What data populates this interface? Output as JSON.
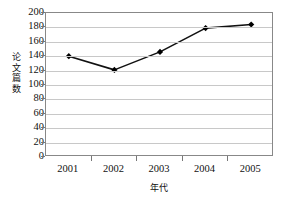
{
  "chart_data": {
    "type": "line",
    "title": "",
    "xlabel": "年代",
    "ylabel": "论文篇数",
    "categories": [
      "2001",
      "2002",
      "2003",
      "2004",
      "2005"
    ],
    "values": [
      140,
      121,
      146,
      179,
      184
    ],
    "series": [
      {
        "name": "论文篇数",
        "values": [
          140,
          121,
          146,
          179,
          184
        ]
      }
    ],
    "ylim": [
      0,
      200
    ],
    "ytick_labels": [
      "0",
      "20",
      "40",
      "60",
      "80",
      "100",
      "120",
      "140",
      "160",
      "180",
      "200"
    ],
    "ytick_values": [
      0,
      20,
      40,
      60,
      80,
      100,
      120,
      140,
      160,
      180,
      200
    ],
    "grid": "horizontal",
    "legend": "none",
    "line_color": "#111111",
    "marker": "diamond",
    "marker_color": "#000000",
    "grid_color": "#c8c8c8",
    "frame_color": "#888888"
  }
}
